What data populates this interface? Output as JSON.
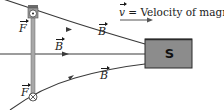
{
  "diagram": {
    "labels": {
      "force_top": "F",
      "force_bottom": "F",
      "field_top": "B",
      "field_middle": "B",
      "field_bottom": "B",
      "velocity_symbol": "v",
      "velocity_text": " = Velocity of magnet",
      "magnet_pole": "S"
    },
    "colors": {
      "field_line": "#3a3a3a",
      "magnet_fill": "#8c8c8c",
      "magnet_border": "#2a2a2a",
      "wire": "#9a9a9a",
      "background": "#ffffff"
    },
    "elements": {
      "top_conductor_symbol": "dot (current out of page)",
      "bottom_conductor_symbol": "cross (current into page)"
    }
  }
}
